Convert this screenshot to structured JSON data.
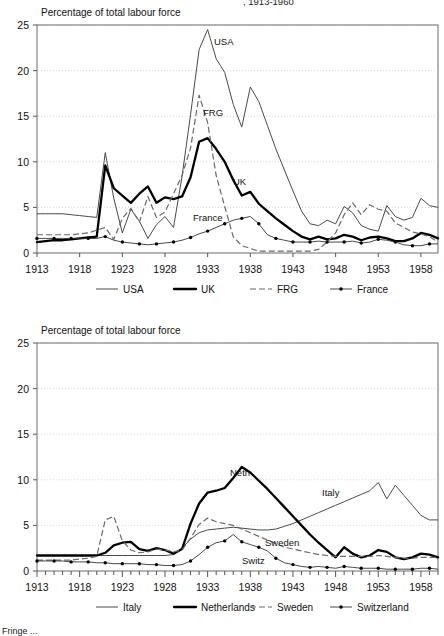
{
  "page": {
    "clipped_header": ", 1913-1960",
    "clipped_footer": "Fringe ..."
  },
  "charts": [
    {
      "id": "top",
      "axis_title": "Percentage of total labour force",
      "chart_data": {
        "type": "line",
        "title": "Percentage of total labour force",
        "xlabel": "",
        "ylabel": "Percentage of total labour force",
        "xlim": [
          1913,
          1960
        ],
        "ylim": [
          0,
          25
        ],
        "yticks": [
          0,
          5,
          10,
          15,
          20,
          25
        ],
        "xticks": [
          1913,
          1918,
          1923,
          1928,
          1933,
          1938,
          1943,
          1948,
          1953,
          1958
        ],
        "grid": true,
        "legend_position": "bottom",
        "x": [
          1913,
          1914,
          1915,
          1916,
          1917,
          1918,
          1919,
          1920,
          1921,
          1922,
          1923,
          1924,
          1925,
          1926,
          1927,
          1928,
          1929,
          1930,
          1931,
          1932,
          1933,
          1934,
          1935,
          1936,
          1937,
          1938,
          1939,
          1940,
          1941,
          1942,
          1943,
          1944,
          1945,
          1946,
          1947,
          1948,
          1949,
          1950,
          1951,
          1952,
          1953,
          1954,
          1955,
          1956,
          1957,
          1958,
          1959,
          1960
        ],
        "series": [
          {
            "name": "USA",
            "style": "thin-solid",
            "label_on_plot": "USA",
            "values": [
              4.3,
              4.3,
              4.3,
              4.3,
              4.2,
              4.1,
              4.0,
              3.9,
              11.0,
              6.0,
              2.2,
              4.8,
              3.5,
              1.6,
              3.1,
              4.0,
              2.8,
              8.4,
              15.2,
              22.3,
              24.5,
              21.3,
              19.8,
              16.3,
              13.8,
              18.2,
              16.6,
              14.0,
              11.4,
              9.1,
              6.8,
              4.6,
              3.2,
              3.0,
              3.6,
              3.2,
              5.1,
              4.4,
              3.0,
              2.6,
              2.4,
              5.2,
              4.0,
              3.6,
              3.9,
              6.0,
              5.2,
              5.0
            ]
          },
          {
            "name": "UK",
            "style": "thick-solid",
            "label_on_plot": "UK",
            "values": [
              1.2,
              1.3,
              1.4,
              1.4,
              1.5,
              1.6,
              1.7,
              1.8,
              9.6,
              7.1,
              6.3,
              5.5,
              6.5,
              7.3,
              5.5,
              6.1,
              5.9,
              6.2,
              8.3,
              12.2,
              12.6,
              11.4,
              10.0,
              8.0,
              6.3,
              6.7,
              5.4,
              4.6,
              3.8,
              3.1,
              2.4,
              1.8,
              1.5,
              1.8,
              1.5,
              1.6,
              2.0,
              1.8,
              1.4,
              1.7,
              1.8,
              1.6,
              1.3,
              1.3,
              1.6,
              2.2,
              2.0,
              1.6
            ]
          },
          {
            "name": "FRG",
            "style": "dashed",
            "label_on_plot": "FRG",
            "values": [
              2.0,
              2.0,
              2.0,
              2.0,
              2.0,
              2.1,
              2.2,
              2.5,
              2.8,
              1.5,
              3.8,
              4.9,
              3.4,
              6.2,
              3.9,
              4.5,
              6.5,
              8.5,
              11.5,
              17.3,
              14.3,
              8.5,
              5.1,
              1.8,
              0.8,
              0.5,
              0.2,
              0.2,
              0.2,
              0.2,
              0.2,
              0.2,
              0.2,
              0.4,
              1.2,
              2.2,
              4.2,
              5.5,
              4.2,
              5.3,
              4.8,
              4.6,
              3.3,
              2.8,
              2.3,
              2.1,
              1.8,
              1.2
            ]
          },
          {
            "name": "France",
            "style": "dot-marker",
            "label_on_plot": "France",
            "values": [
              1.6,
              1.6,
              1.6,
              1.6,
              1.6,
              1.6,
              1.6,
              1.6,
              1.8,
              1.4,
              1.2,
              1.1,
              1.0,
              0.9,
              1.0,
              1.1,
              1.2,
              1.4,
              1.7,
              2.1,
              2.4,
              2.8,
              3.2,
              3.6,
              3.8,
              4.0,
              3.2,
              2.0,
              1.6,
              1.4,
              1.2,
              1.2,
              1.2,
              1.3,
              1.2,
              1.2,
              1.2,
              1.3,
              1.1,
              1.2,
              1.5,
              1.4,
              1.2,
              0.9,
              0.8,
              0.8,
              1.0,
              1.0
            ]
          }
        ]
      },
      "legend": [
        {
          "label": "USA",
          "style": "thin-solid"
        },
        {
          "label": "UK",
          "style": "thick-solid"
        },
        {
          "label": "FRG",
          "style": "dashed"
        },
        {
          "label": "France",
          "style": "dot-marker"
        }
      ]
    },
    {
      "id": "bottom",
      "axis_title": "Percentage of total labour force",
      "chart_data": {
        "type": "line",
        "title": "Percentage of total labour force",
        "xlabel": "",
        "ylabel": "Percentage of total labour force",
        "xlim": [
          1913,
          1960
        ],
        "ylim": [
          0,
          25
        ],
        "yticks": [
          0,
          5,
          10,
          15,
          20,
          25
        ],
        "xticks": [
          1913,
          1918,
          1923,
          1928,
          1933,
          1938,
          1943,
          1948,
          1953,
          1958
        ],
        "grid": true,
        "legend_position": "bottom",
        "x": [
          1913,
          1914,
          1915,
          1916,
          1917,
          1918,
          1919,
          1920,
          1921,
          1922,
          1923,
          1924,
          1925,
          1926,
          1927,
          1928,
          1929,
          1930,
          1931,
          1932,
          1933,
          1934,
          1935,
          1936,
          1937,
          1938,
          1939,
          1940,
          1941,
          1942,
          1943,
          1944,
          1945,
          1946,
          1947,
          1948,
          1949,
          1950,
          1951,
          1952,
          1953,
          1954,
          1955,
          1956,
          1957,
          1958,
          1959,
          1960
        ],
        "series": [
          {
            "name": "Italy",
            "style": "thin-solid",
            "label_on_plot": "Italy",
            "values": [
              1.7,
              1.7,
              1.7,
              1.7,
              1.7,
              1.7,
              1.7,
              1.7,
              1.7,
              1.7,
              1.7,
              1.7,
              1.7,
              1.7,
              1.7,
              1.7,
              1.8,
              2.5,
              3.5,
              4.2,
              4.5,
              4.6,
              4.7,
              4.8,
              4.7,
              4.6,
              4.5,
              4.5,
              4.6,
              4.9,
              5.2,
              5.6,
              6.0,
              6.4,
              6.8,
              7.2,
              7.6,
              8.0,
              8.4,
              8.8,
              9.7,
              7.9,
              9.4,
              8.3,
              7.2,
              6.1,
              5.6,
              5.6
            ]
          },
          {
            "name": "Netherlands",
            "style": "thick-solid",
            "label_on_plot": "Neth",
            "values": [
              1.7,
              1.7,
              1.7,
              1.7,
              1.7,
              1.7,
              1.7,
              1.7,
              2.0,
              2.8,
              3.1,
              3.2,
              2.4,
              2.2,
              2.5,
              2.3,
              1.9,
              2.4,
              5.2,
              7.4,
              8.6,
              8.8,
              9.1,
              10.2,
              11.4,
              10.8,
              9.9,
              9.0,
              8.0,
              7.0,
              6.0,
              5.0,
              4.0,
              3.1,
              2.3,
              1.5,
              2.6,
              1.9,
              1.5,
              1.7,
              2.3,
              2.1,
              1.5,
              1.3,
              1.5,
              1.9,
              1.8,
              1.5
            ]
          },
          {
            "name": "Sweden",
            "style": "dashed",
            "label_on_plot": "Sweden",
            "values": [
              1.2,
              1.2,
              1.2,
              1.2,
              1.2,
              1.3,
              1.4,
              1.6,
              5.6,
              6.0,
              3.3,
              2.3,
              2.0,
              2.1,
              2.4,
              2.3,
              2.1,
              2.3,
              3.6,
              5.1,
              5.8,
              5.4,
              5.2,
              5.0,
              4.6,
              4.2,
              3.8,
              3.4,
              3.0,
              2.6,
              2.4,
              2.2,
              2.0,
              1.8,
              1.7,
              1.6,
              1.6,
              1.6,
              1.6,
              1.6,
              1.7,
              1.6,
              1.5,
              1.4,
              1.4,
              1.5,
              1.5,
              1.5
            ]
          },
          {
            "name": "Switzerland",
            "style": "dot-marker",
            "label_on_plot": "Switz",
            "values": [
              1.1,
              1.1,
              1.1,
              1.1,
              1.0,
              1.0,
              1.0,
              0.9,
              0.9,
              0.8,
              0.8,
              0.8,
              0.8,
              0.7,
              0.7,
              0.6,
              0.6,
              0.7,
              1.1,
              1.8,
              2.6,
              3.1,
              3.3,
              4.0,
              3.2,
              2.9,
              2.6,
              2.2,
              1.4,
              0.9,
              0.7,
              0.5,
              0.4,
              0.5,
              0.4,
              0.3,
              0.5,
              0.4,
              0.3,
              0.3,
              0.3,
              0.2,
              0.2,
              0.2,
              0.2,
              0.3,
              0.3,
              0.2
            ]
          }
        ]
      },
      "legend": [
        {
          "label": "Italy",
          "style": "thin-solid"
        },
        {
          "label": "Netherlands",
          "style": "thick-solid"
        },
        {
          "label": "Sweden",
          "style": "dashed"
        },
        {
          "label": "Switzerland",
          "style": "dot-marker"
        }
      ]
    }
  ]
}
